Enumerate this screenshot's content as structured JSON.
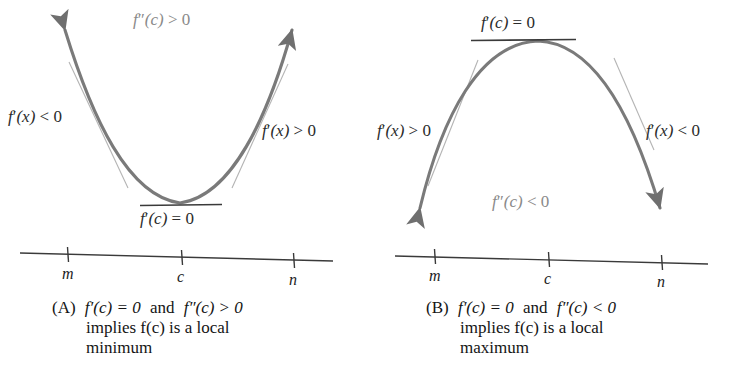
{
  "figure": {
    "curve_color": "#7a7a7a",
    "tangent_color": "#9a9a9a",
    "axis_color": "#3a3a3a",
    "label_gray": "#8a8a8a",
    "text_color": "#141414"
  },
  "panel_a": {
    "id": "A",
    "curve_type": "upward-parabola",
    "top_label": {
      "text": "f″(c) > 0",
      "f": "f",
      "primes": "″",
      "arg": "(c)",
      "rel": "> 0",
      "color": "#8a8a8a"
    },
    "left_label": {
      "text": "f′(x) < 0",
      "f": "f",
      "primes": "′",
      "arg": "(x)",
      "rel": "< 0"
    },
    "right_label": {
      "text": "f′(x) > 0",
      "f": "f",
      "primes": "′",
      "arg": "(x)",
      "rel": "> 0"
    },
    "vertex_label": {
      "text": "f′(c) = 0",
      "f": "f",
      "primes": "′",
      "arg": "(c)",
      "rel": "= 0",
      "position": "below-tangent"
    },
    "axis": {
      "ticks": [
        "m",
        "c",
        "n"
      ]
    },
    "caption": {
      "tag": "(A)",
      "line1_a": "f′(c) = 0",
      "line1_and": "and",
      "line1_b": "f″(c) > 0",
      "line2": "implies f(c) is a local",
      "line3": "minimum"
    }
  },
  "panel_b": {
    "id": "B",
    "curve_type": "downward-parabola",
    "vertex_label": {
      "text": "f′(c) = 0",
      "f": "f",
      "primes": "′",
      "arg": "(c)",
      "rel": "= 0",
      "position": "above-tangent"
    },
    "left_label": {
      "text": "f′(x) > 0",
      "f": "f",
      "primes": "′",
      "arg": "(x)",
      "rel": "> 0"
    },
    "right_label": {
      "text": "f′(x) < 0",
      "f": "f",
      "primes": "′",
      "arg": "(x)",
      "rel": "< 0"
    },
    "bottom_label": {
      "text": "f″(c) < 0",
      "f": "f",
      "primes": "″",
      "arg": "(c)",
      "rel": "< 0",
      "color": "#8a8a8a"
    },
    "axis": {
      "ticks": [
        "m",
        "c",
        "n"
      ]
    },
    "caption": {
      "tag": "(B)",
      "line1_a": "f′(c) = 0",
      "line1_and": "and",
      "line1_b": "f″(c) < 0",
      "line2": "implies f(c) is a local",
      "line3": "maximum"
    }
  },
  "chart_data": {
    "type": "line",
    "panels": [
      {
        "label": "(A)",
        "curve": "parabola opening upward, vertex at c",
        "vertex_x": "c",
        "slope_left_of_c": "negative",
        "slope_right_of_c": "positive",
        "slope_at_c": 0,
        "concavity": "positive",
        "conclusion": "local minimum",
        "axis_ticks": [
          "m",
          "c",
          "n"
        ]
      },
      {
        "label": "(B)",
        "curve": "parabola opening downward, vertex at c",
        "vertex_x": "c",
        "slope_left_of_c": "positive",
        "slope_right_of_c": "negative",
        "slope_at_c": 0,
        "concavity": "negative",
        "conclusion": "local maximum",
        "axis_ticks": [
          "m",
          "c",
          "n"
        ]
      }
    ],
    "grid": false,
    "legend": "none"
  }
}
